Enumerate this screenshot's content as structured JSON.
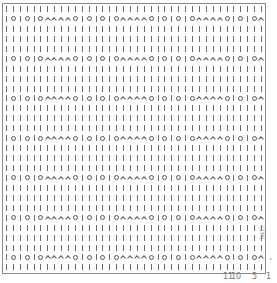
{
  "chart_data": {
    "type": "knitting-chart",
    "columns": 38,
    "rows": 27,
    "repeat_stitches": 11,
    "symbols": {
      "|": "knit",
      "O": "yarn-over",
      "^": "decrease"
    },
    "plain_row": "||||||||||||||||||||||||||||||||||||||",
    "pattern_row": "|O|O|O^^^^O|O|O|O^^^^O|O|O|O^^^^O|O|O^^",
    "row_types": [
      "plain",
      "pattern",
      "plain",
      "plain",
      "plain",
      "pattern",
      "plain",
      "plain",
      "plain",
      "pattern",
      "plain",
      "plain",
      "plain",
      "pattern",
      "plain",
      "plain",
      "plain",
      "pattern",
      "plain",
      "plain",
      "plain",
      "pattern",
      "plain",
      "plain",
      "plain",
      "pattern",
      "plain"
    ],
    "column_labels": [
      {
        "text": "11",
        "x": 223
      },
      {
        "text": "10",
        "x": 232
      },
      {
        "text": "5",
        "x": 253
      },
      {
        "text": "1",
        "x": 267
      }
    ],
    "side_label": "(1M)"
  }
}
